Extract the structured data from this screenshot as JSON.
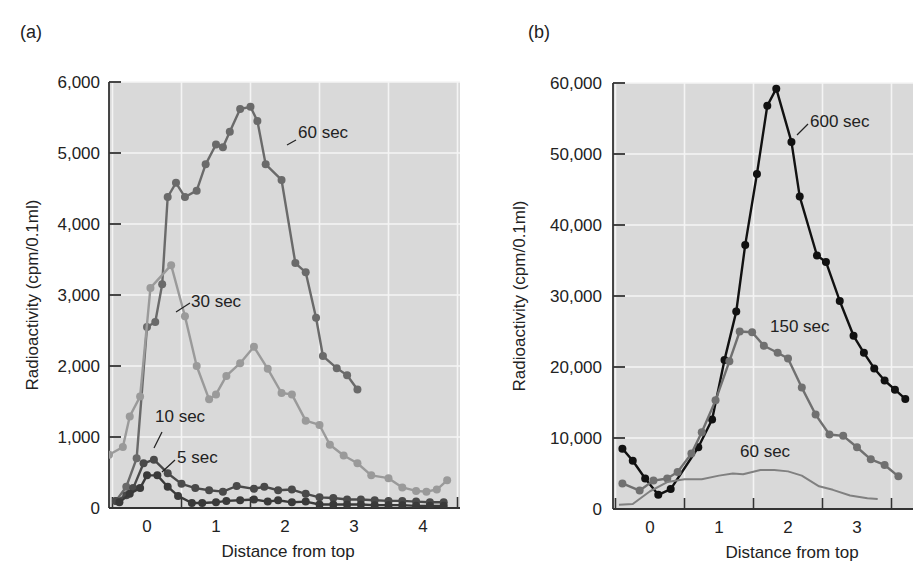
{
  "figure": {
    "panels": [
      {
        "label": "(a)"
      },
      {
        "label": "(b)"
      }
    ]
  },
  "chart_data": [
    {
      "panel": "(a)",
      "type": "line",
      "title": "",
      "xlabel": "Distance from top",
      "ylabel": "Radioactivity (cpm/0.1ml)",
      "xlim": [
        -0.55,
        4.55
      ],
      "ylim": [
        0,
        6000
      ],
      "xticks": [
        0,
        1,
        2,
        3,
        4
      ],
      "xtick_labels": [
        "0",
        "1",
        "2",
        "3",
        "4"
      ],
      "yticks": [
        0,
        1000,
        2000,
        3000,
        4000,
        5000,
        6000
      ],
      "ytick_labels": [
        "0",
        "1,000",
        "2,000",
        "3,000",
        "4,000",
        "5,000",
        "6,000"
      ],
      "grid": true,
      "background": "#d9d9d9",
      "series": [
        {
          "name": "60 sec",
          "color": "#6a6a6a",
          "x": [
            -0.45,
            -0.3,
            -0.15,
            0.0,
            0.12,
            0.22,
            0.3,
            0.42,
            0.55,
            0.72,
            0.85,
            1.0,
            1.1,
            1.2,
            1.35,
            1.5,
            1.6,
            1.72,
            1.95,
            2.15,
            2.3,
            2.45,
            2.55,
            2.75,
            2.9,
            3.05,
            3.15,
            3.3
          ],
          "y": [
            100,
            300,
            700,
            2550,
            2620,
            3150,
            4380,
            4580,
            4380,
            4470,
            4840,
            5120,
            5080,
            5300,
            5620,
            5650,
            5450,
            4840,
            4620,
            3450,
            3320,
            2680,
            2140,
            1970,
            1870,
            1670,
            null,
            null
          ]
        },
        {
          "name": "30 sec",
          "color": "#9a9a9a",
          "x": [
            -0.55,
            -0.35,
            -0.25,
            -0.1,
            0.05,
            0.35,
            0.55,
            0.72,
            0.9,
            1.0,
            1.15,
            1.35,
            1.55,
            1.75,
            1.95,
            2.1,
            2.3,
            2.5,
            2.65,
            2.85,
            3.05,
            3.25,
            3.5,
            3.7,
            3.9,
            4.05,
            4.2,
            4.35
          ],
          "y": [
            750,
            860,
            1290,
            1570,
            3100,
            3420,
            2700,
            2000,
            1530,
            1600,
            1860,
            2040,
            2270,
            1960,
            1620,
            1600,
            1230,
            1170,
            890,
            740,
            630,
            460,
            420,
            290,
            240,
            230,
            260,
            390
          ]
        },
        {
          "name": "10 sec",
          "color": "#4a4a4a",
          "x": [
            -0.45,
            -0.3,
            -0.2,
            -0.05,
            0.1,
            0.3,
            0.5,
            0.7,
            0.9,
            1.1,
            1.3,
            1.55,
            1.7,
            1.9,
            2.1,
            2.3,
            2.5,
            2.7,
            2.9,
            3.1,
            3.3,
            3.5,
            3.7,
            3.9,
            4.1,
            4.3
          ],
          "y": [
            100,
            180,
            280,
            630,
            680,
            490,
            340,
            280,
            250,
            230,
            310,
            270,
            300,
            250,
            260,
            200,
            150,
            140,
            120,
            120,
            110,
            100,
            100,
            90,
            80,
            80
          ]
        },
        {
          "name": "5 sec",
          "color": "#3a3a3a",
          "x": [
            -0.4,
            -0.25,
            -0.1,
            0.0,
            0.15,
            0.3,
            0.45,
            0.65,
            0.8,
            1.0,
            1.15,
            1.35,
            1.55,
            1.75,
            1.9,
            2.1,
            2.3,
            2.5,
            2.7,
            2.9,
            3.1,
            3.3,
            3.5,
            3.7,
            3.9,
            4.1,
            4.3
          ],
          "y": [
            80,
            200,
            280,
            460,
            460,
            300,
            170,
            70,
            70,
            80,
            100,
            110,
            120,
            90,
            110,
            80,
            90,
            50,
            50,
            50,
            50,
            40,
            40,
            40,
            30,
            30,
            30
          ]
        }
      ],
      "annotations": [
        "60 sec",
        "30 sec",
        "10 sec",
        "5 sec"
      ]
    },
    {
      "panel": "(b)",
      "type": "line",
      "title": "",
      "xlabel": "Distance from top",
      "ylabel": "Radioactivity (cpm/0.1ml)",
      "xlim": [
        -0.55,
        3.75
      ],
      "ylim": [
        0,
        60000
      ],
      "xticks": [
        0,
        1,
        2,
        3
      ],
      "xtick_labels": [
        "0",
        "1",
        "2",
        "3"
      ],
      "yticks": [
        0,
        10000,
        20000,
        30000,
        40000,
        50000,
        60000
      ],
      "ytick_labels": [
        "0",
        "10,000",
        "20,000",
        "30,000",
        "40,000",
        "50,000",
        "60,000"
      ],
      "grid": true,
      "background": "#d9d9d9",
      "series": [
        {
          "name": "600 sec",
          "color": "#111111",
          "x": [
            -0.4,
            -0.25,
            -0.07,
            0.12,
            0.3,
            0.7,
            0.9,
            1.08,
            1.25,
            1.38,
            1.55,
            1.7,
            1.83,
            2.05,
            2.17,
            2.42,
            2.55,
            2.75,
            2.95,
            3.1,
            3.25,
            3.4,
            3.55,
            3.7
          ],
          "y": [
            8500,
            6800,
            4300,
            2000,
            2800,
            8700,
            12600,
            21000,
            27800,
            37200,
            47200,
            56800,
            59200,
            51700,
            44000,
            35700,
            34800,
            29300,
            24400,
            22000,
            19800,
            18100,
            16800,
            15500
          ]
        },
        {
          "name": "150 sec",
          "color": "#707070",
          "x": [
            -0.4,
            -0.15,
            0.05,
            0.25,
            0.4,
            0.6,
            0.75,
            0.95,
            1.15,
            1.3,
            1.48,
            1.65,
            1.85,
            2.0,
            2.2,
            2.4,
            2.6,
            2.8,
            3.0,
            3.2,
            3.4,
            3.6
          ],
          "y": [
            3600,
            2600,
            4000,
            4300,
            5200,
            7800,
            10800,
            15300,
            20800,
            25000,
            24900,
            23000,
            22000,
            21200,
            17100,
            13300,
            10500,
            10300,
            8700,
            7000,
            6200,
            4600
          ]
        },
        {
          "name": "60 sec",
          "color": "#808080",
          "line_only": true,
          "x": [
            -0.45,
            -0.25,
            0.0,
            0.25,
            0.5,
            0.75,
            1.0,
            1.2,
            1.35,
            1.6,
            1.8,
            2.0,
            2.2,
            2.45,
            2.65,
            2.9,
            3.15,
            3.3
          ],
          "y": [
            600,
            700,
            2500,
            3800,
            4200,
            4200,
            4700,
            5000,
            4900,
            5500,
            5500,
            5300,
            4700,
            3200,
            2700,
            1900,
            1500,
            1400
          ]
        }
      ],
      "annotations": [
        "600 sec",
        "150 sec",
        "60 sec"
      ]
    }
  ]
}
